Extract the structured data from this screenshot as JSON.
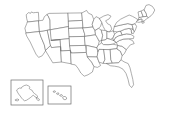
{
  "map": {
    "title": "United States Blank Outline Map",
    "type": "choropleth-base",
    "projection": "albers-usa",
    "background_color": "#ffffff",
    "border_color": "#6b6b6b",
    "fill_color": "#ffffff",
    "border_width_px": 0.55,
    "labels_visible": false,
    "legend_visible": false,
    "insets": [
      {
        "id": "alaska",
        "name": "Alaska",
        "frame": {
          "x": 11,
          "y": 80,
          "width": 32,
          "height": 25
        },
        "frame_visible": true
      },
      {
        "id": "hawaii",
        "name": "Hawaii",
        "frame": {
          "x": 48,
          "y": 86,
          "width": 23,
          "height": 18
        },
        "frame_visible": true
      }
    ],
    "regions": [
      {
        "id": "WA",
        "name": "Washington"
      },
      {
        "id": "OR",
        "name": "Oregon"
      },
      {
        "id": "CA",
        "name": "California"
      },
      {
        "id": "NV",
        "name": "Nevada"
      },
      {
        "id": "ID",
        "name": "Idaho"
      },
      {
        "id": "MT",
        "name": "Montana"
      },
      {
        "id": "WY",
        "name": "Wyoming"
      },
      {
        "id": "UT",
        "name": "Utah"
      },
      {
        "id": "AZ",
        "name": "Arizona"
      },
      {
        "id": "CO",
        "name": "Colorado"
      },
      {
        "id": "NM",
        "name": "New Mexico"
      },
      {
        "id": "ND",
        "name": "North Dakota"
      },
      {
        "id": "SD",
        "name": "South Dakota"
      },
      {
        "id": "NE",
        "name": "Nebraska"
      },
      {
        "id": "KS",
        "name": "Kansas"
      },
      {
        "id": "OK",
        "name": "Oklahoma"
      },
      {
        "id": "TX",
        "name": "Texas"
      },
      {
        "id": "MN",
        "name": "Minnesota"
      },
      {
        "id": "IA",
        "name": "Iowa"
      },
      {
        "id": "MO",
        "name": "Missouri"
      },
      {
        "id": "AR",
        "name": "Arkansas"
      },
      {
        "id": "LA",
        "name": "Louisiana"
      },
      {
        "id": "WI",
        "name": "Wisconsin"
      },
      {
        "id": "IL",
        "name": "Illinois"
      },
      {
        "id": "MI",
        "name": "Michigan"
      },
      {
        "id": "IN",
        "name": "Indiana"
      },
      {
        "id": "OH",
        "name": "Ohio"
      },
      {
        "id": "KY",
        "name": "Kentucky"
      },
      {
        "id": "TN",
        "name": "Tennessee"
      },
      {
        "id": "MS",
        "name": "Mississippi"
      },
      {
        "id": "AL",
        "name": "Alabama"
      },
      {
        "id": "GA",
        "name": "Georgia"
      },
      {
        "id": "FL",
        "name": "Florida"
      },
      {
        "id": "SC",
        "name": "South Carolina"
      },
      {
        "id": "NC",
        "name": "North Carolina"
      },
      {
        "id": "VA",
        "name": "Virginia"
      },
      {
        "id": "WV",
        "name": "West Virginia"
      },
      {
        "id": "MD",
        "name": "Maryland"
      },
      {
        "id": "DE",
        "name": "Delaware"
      },
      {
        "id": "PA",
        "name": "Pennsylvania"
      },
      {
        "id": "NJ",
        "name": "New Jersey"
      },
      {
        "id": "NY",
        "name": "New York"
      },
      {
        "id": "CT",
        "name": "Connecticut"
      },
      {
        "id": "RI",
        "name": "Rhode Island"
      },
      {
        "id": "MA",
        "name": "Massachusetts"
      },
      {
        "id": "VT",
        "name": "Vermont"
      },
      {
        "id": "NH",
        "name": "New Hampshire"
      },
      {
        "id": "ME",
        "name": "Maine"
      },
      {
        "id": "AK",
        "name": "Alaska"
      },
      {
        "id": "HI",
        "name": "Hawaii"
      }
    ]
  }
}
